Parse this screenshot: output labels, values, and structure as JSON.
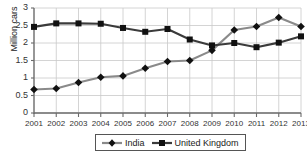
{
  "chart_data": {
    "type": "line",
    "title": "",
    "xlabel": "",
    "ylabel": "Million cars",
    "categories": [
      "2001",
      "2002",
      "2003",
      "2004",
      "2005",
      "2006",
      "2007",
      "2008",
      "2009",
      "2010",
      "2011",
      "2012",
      "2013"
    ],
    "ylim": [
      0,
      3
    ],
    "ytick_labels": [
      "0",
      "0.5",
      "1",
      "1.5",
      "2",
      "2.5",
      "3"
    ],
    "ytick_values": [
      0,
      0.5,
      1,
      1.5,
      2,
      2.5,
      3
    ],
    "grid": true,
    "legend_position": "bottom",
    "series": [
      {
        "name": "India",
        "color": "#8a8a8a",
        "marker": "diamond",
        "marker_color": "#111111",
        "values": [
          0.67,
          0.7,
          0.87,
          1.02,
          1.06,
          1.28,
          1.47,
          1.5,
          1.79,
          2.37,
          2.47,
          2.73,
          2.47
        ]
      },
      {
        "name": "United Kingdom",
        "color": "#3b3b3b",
        "marker": "square",
        "marker_color": "#111111",
        "values": [
          2.46,
          2.56,
          2.56,
          2.55,
          2.43,
          2.32,
          2.4,
          2.1,
          1.93,
          2.0,
          1.88,
          2.01,
          2.19
        ]
      }
    ]
  },
  "legend": {
    "items": [
      {
        "label": "India"
      },
      {
        "label": "United Kingdom"
      }
    ]
  },
  "axes": {
    "y_title": "Million cars"
  }
}
